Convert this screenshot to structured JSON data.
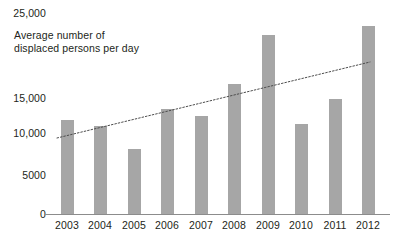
{
  "chart_data": {
    "type": "bar",
    "title": "Average number of\ndisplaced persons per day",
    "xlabel": "",
    "ylabel": "",
    "categories": [
      "2003",
      "2004",
      "2005",
      "2006",
      "2007",
      "2008",
      "2009",
      "2010",
      "2011",
      "2012"
    ],
    "values": [
      11500,
      10700,
      8000,
      12800,
      11900,
      15800,
      21800,
      11000,
      14000,
      22800
    ],
    "series": [
      {
        "name": "Average number of displaced persons per day",
        "type": "bar",
        "values": [
          11500,
          10700,
          8000,
          12800,
          11900,
          15800,
          21800,
          11000,
          14000,
          22800
        ]
      },
      {
        "name": "trendline",
        "type": "line",
        "style": "dotted",
        "values": [
          9700,
          10620,
          11540,
          12460,
          13380,
          14300,
          15220,
          16140,
          17060,
          18000
        ]
      }
    ],
    "ylim": [
      0,
      25000
    ],
    "ytick_labels": [
      "25,000",
      "15,000",
      "10,000",
      "5000",
      "0"
    ],
    "ytick_values": [
      25000,
      15000,
      10000,
      5000,
      0
    ],
    "grid": false,
    "legend": "none",
    "bar_color": "#a6a6a6",
    "axis_color": "#8c8c8c",
    "text_color": "#231f20",
    "trendline_color": "#4d4d4d"
  },
  "axis": {
    "y_labels": [
      {
        "text": "25,000",
        "top": 8
      },
      {
        "text": "15,000",
        "top": 93
      },
      {
        "text": "10,000",
        "top": 128
      },
      {
        "text": "5000",
        "top": 170
      },
      {
        "text": "0",
        "top": 209
      }
    ],
    "x_labels": [
      {
        "text": "2003",
        "left": 50
      },
      {
        "text": "2004",
        "left": 83
      },
      {
        "text": "2005",
        "left": 117
      },
      {
        "text": "2006",
        "left": 150
      },
      {
        "text": "2007",
        "left": 184
      },
      {
        "text": "2008",
        "left": 217
      },
      {
        "text": "2009",
        "left": 251
      },
      {
        "text": "2010",
        "left": 284
      },
      {
        "text": "2011",
        "left": 318
      },
      {
        "text": "2012",
        "left": 351
      }
    ]
  },
  "bars": [
    {
      "year": "2003",
      "value": 11500,
      "left": 61,
      "top": 120,
      "height": 95
    },
    {
      "year": "2004",
      "value": 10700,
      "left": 94,
      "top": 126,
      "height": 89
    },
    {
      "year": "2005",
      "value": 8000,
      "left": 128,
      "top": 152,
      "height": 63
    },
    {
      "year": "2006",
      "value": 12800,
      "left": 161,
      "top": 110,
      "height": 105
    },
    {
      "year": "2007",
      "value": 11900,
      "left": 195,
      "top": 117,
      "height": 98
    },
    {
      "year": "2008",
      "value": 15800,
      "left": 228,
      "top": 87,
      "height": 128
    },
    {
      "year": "2009",
      "value": 21800,
      "left": 262,
      "top": 34,
      "height": 181
    },
    {
      "year": "2010",
      "value": 11000,
      "left": 295,
      "top": 124,
      "height": 91
    },
    {
      "year": "2011",
      "value": 14000,
      "left": 329,
      "top": 102,
      "height": 113
    },
    {
      "year": "2012",
      "value": 22800,
      "left": 362,
      "top": 27,
      "height": 188
    }
  ],
  "trendline": {
    "x1": 57,
    "y1": 138,
    "x2": 370,
    "y2": 62,
    "start_value": 9700,
    "end_value": 18000
  }
}
